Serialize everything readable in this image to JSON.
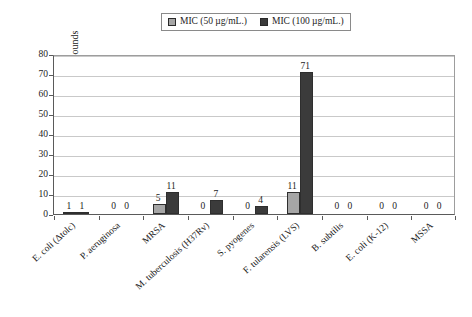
{
  "chart_data": {
    "type": "bar",
    "title": "",
    "xlabel": "",
    "ylabel": "Counts of Compounds",
    "ylim": [
      0,
      80
    ],
    "ytick_step": 10,
    "yticks": [
      "0",
      "10",
      "20",
      "30",
      "40",
      "50",
      "60",
      "70",
      "80"
    ],
    "grid": true,
    "legend_position": "top-center",
    "categories": [
      "E. coli (Δtolc)",
      "P. aeruginosa",
      "MRSA",
      "M. tuberculosis (H37Rv)",
      "S. pyogenes",
      "F. tularensis (LVS)",
      "B. subtilis",
      "E. coli (K-12)",
      "MSSA"
    ],
    "series": [
      {
        "name": "MIC (50 µg/mL.)",
        "color": "#a6a6a6",
        "values": [
          1,
          0,
          5,
          0,
          0,
          11,
          0,
          0,
          0
        ]
      },
      {
        "name": "MIC (100 µg/mL.)",
        "color": "#3b3b3b",
        "values": [
          1,
          0,
          11,
          7,
          4,
          71,
          0,
          0,
          0
        ]
      }
    ]
  },
  "legend": {
    "items": [
      {
        "label": "MIC (50 µg/mL.)",
        "swatch": "light-gray-swatch"
      },
      {
        "label": "MIC (100 µg/mL.)",
        "swatch": "dark-gray-swatch"
      }
    ]
  },
  "axes": {
    "y_title": "Counts of Compounds"
  }
}
